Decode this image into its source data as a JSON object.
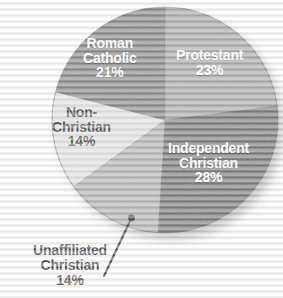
{
  "chart_data": {
    "type": "pie",
    "title": "",
    "subtitle": "",
    "xlabel": "",
    "ylabel": "",
    "legend_position": "none",
    "grid": false,
    "units": "percent",
    "total": 100,
    "categories": [
      "Protestant",
      "Independent Christian",
      "Unaffiliated Christian",
      "Non-Christian",
      "Roman Catholic"
    ],
    "values": [
      23,
      28,
      14,
      14,
      21
    ],
    "slices": [
      {
        "label": "Protestant",
        "label_line_1": "Protestant",
        "value": 23,
        "value_text": "23%",
        "color": "#8e8e8e",
        "text_color": "#ffffff",
        "label_placement": "inside",
        "start_angle": 0,
        "end_angle": 82.8
      },
      {
        "label": "Independent Christian",
        "label_line_1": "Independent",
        "label_line_2": "Christian",
        "value": 28,
        "value_text": "28%",
        "color": "#474747",
        "text_color": "#ffffff",
        "label_placement": "inside",
        "start_angle": 82.8,
        "end_angle": 183.6
      },
      {
        "label": "Unaffiliated Christian",
        "label_line_1": "Unaffiliated",
        "label_line_2": "Christian",
        "value": 14,
        "value_text": "14%",
        "color": "#9b9b9b",
        "text_color": "#0e0e0e",
        "label_placement": "outside",
        "start_angle": 183.6,
        "end_angle": 234.0
      },
      {
        "label": "Non-Christian",
        "label_line_1": "Non-",
        "label_line_2": "Christian",
        "value": 14,
        "value_text": "14%",
        "color": "#d9d9d9",
        "text_color": "#121212",
        "label_placement": "inside",
        "start_angle": 234.0,
        "end_angle": 284.4
      },
      {
        "label": "Roman Catholic",
        "label_line_1": "Roman",
        "label_line_2": "Catholic",
        "value": 21,
        "value_text": "21%",
        "color": "#5d5d5d",
        "text_color": "#ffffff",
        "label_placement": "inside",
        "start_angle": 284.4,
        "end_angle": 360
      }
    ]
  },
  "labels": {
    "protestant": {
      "line1": "Protestant",
      "pct": "23%"
    },
    "independent": {
      "line1": "Independent",
      "line2": "Christian",
      "pct": "28%"
    },
    "roman_catholic": {
      "line1": "Roman",
      "line2": "Catholic",
      "pct": "21%"
    },
    "non_christian": {
      "line1": "Non-",
      "line2": "Christian",
      "pct": "14%"
    },
    "unaffiliated": {
      "line1": "Unaffiliated",
      "line2": "Christian",
      "pct": "14%"
    }
  },
  "colors": {
    "background": "#f2f2f0",
    "protestant": "#8e8e8e",
    "independent_christian": "#474747",
    "unaffiliated_christian": "#9b9b9b",
    "non_christian": "#d9d9d9",
    "roman_catholic": "#5d5d5d",
    "leader_line": "#111111",
    "label_light": "#ffffff",
    "label_dark": "#0e0e0e"
  }
}
